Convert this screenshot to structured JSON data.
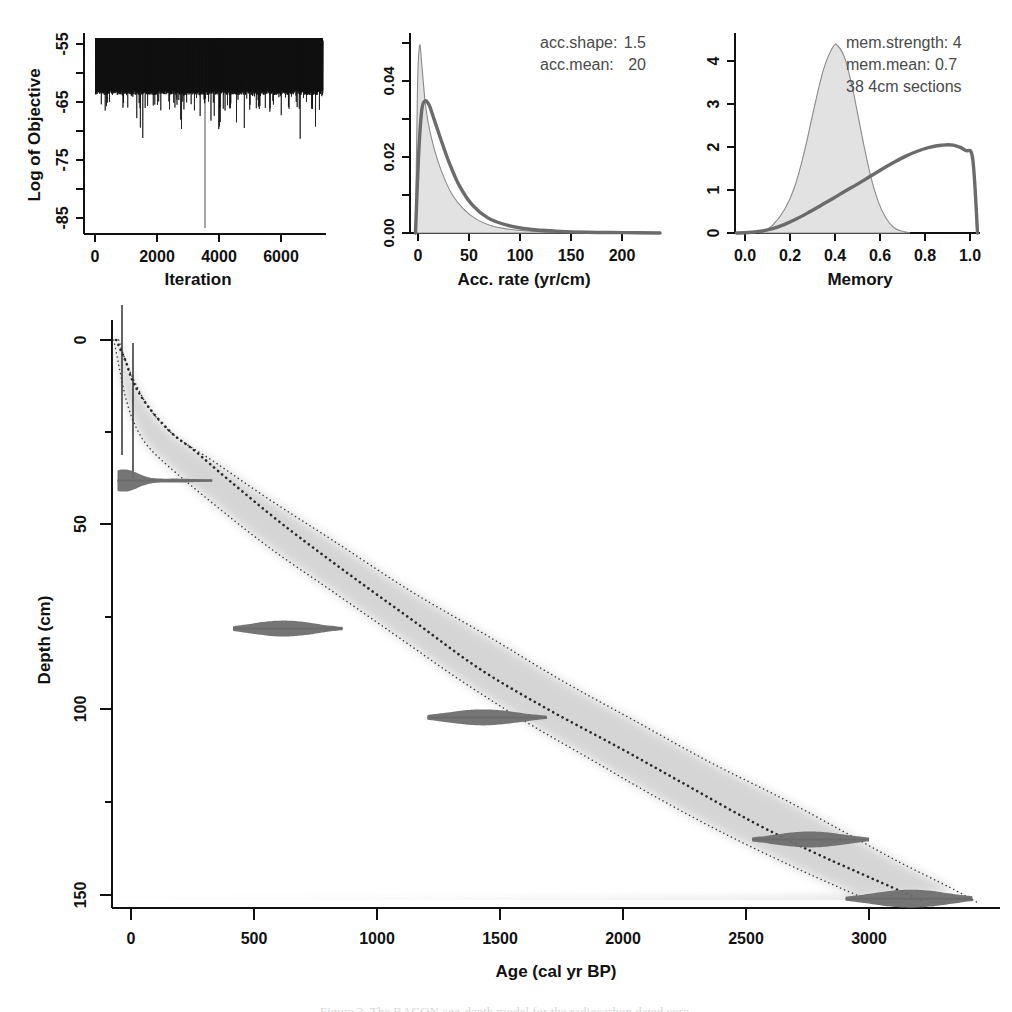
{
  "figure": {
    "caption": "Figure 3. The BACON age-depth model for the radiocarbon dated core."
  },
  "panels": {
    "mcmc": {
      "name": "Log of Objective trace",
      "ylabel": "Log of Objective",
      "xlabel": "Iteration",
      "yticks": [
        "-85",
        "-75",
        "-65",
        "-55"
      ],
      "ytick_values": [
        -85,
        -75,
        -65,
        -55
      ],
      "xticks": [
        "0",
        "2000",
        "4000",
        "6000"
      ],
      "xtick_values": [
        0,
        2000,
        4000,
        6000
      ],
      "xlim": [
        -300,
        7600
      ],
      "ylim": [
        -88,
        -52
      ]
    },
    "acc": {
      "name": "Accumulation rate prior and posterior",
      "xlabel": "Acc. rate (yr/cm)",
      "yticks": [
        "0.00",
        "0.02",
        "0.04"
      ],
      "ytick_values": [
        0.0,
        0.02,
        0.04
      ],
      "xticks": [
        "0",
        "50",
        "100",
        "150",
        "200"
      ],
      "xtick_values": [
        0,
        50,
        100,
        150,
        200
      ],
      "xlim": [
        -12,
        235
      ],
      "ylim": [
        0,
        0.053
      ],
      "annotations": [
        {
          "label": "acc.shape:",
          "value": "1.5"
        },
        {
          "label": "acc.mean:",
          "value": "20"
        }
      ]
    },
    "memory": {
      "name": "Memory prior and posterior",
      "xlabel": "Memory",
      "yticks": [
        "0",
        "1",
        "2",
        "3",
        "4"
      ],
      "ytick_values": [
        0,
        1,
        2,
        3,
        4
      ],
      "xticks": [
        "0.0",
        "0.2",
        "0.4",
        "0.6",
        "0.8",
        "1.0"
      ],
      "xtick_values": [
        0.0,
        0.2,
        0.4,
        0.6,
        0.8,
        1.0
      ],
      "xlim": [
        -0.06,
        1.06
      ],
      "ylim": [
        0,
        4.6
      ],
      "annotations": [
        {
          "label": "mem.strength:",
          "value": "4"
        },
        {
          "label": "mem.mean:",
          "value": "0.7"
        },
        {
          "label": "38 4cm sections",
          "value": ""
        }
      ]
    },
    "agedepth": {
      "name": "Age-depth model",
      "xlabel": "Age (cal yr BP)",
      "ylabel": "Depth (cm)",
      "xticks": [
        "0",
        "500",
        "1000",
        "1500",
        "2000",
        "2500",
        "3000"
      ],
      "xtick_values": [
        0,
        500,
        1000,
        1500,
        2000,
        2500,
        3000
      ],
      "yticks": [
        "0",
        "50",
        "100",
        "150"
      ],
      "ytick_values": [
        0,
        50,
        100,
        150
      ],
      "xlim": [
        -120,
        3560
      ],
      "ylim": [
        -8,
        160
      ]
    }
  },
  "chart_data": [
    {
      "type": "line",
      "name": "mcmc-trace",
      "title": "Log of Objective",
      "xlabel": "Iteration",
      "ylabel": "Log of Objective",
      "xlim": [
        -300,
        7600
      ],
      "ylim": [
        -88,
        -52
      ],
      "xticks": [
        0,
        2000,
        4000,
        6000
      ],
      "yticks": [
        -85,
        -75,
        -65,
        -55
      ],
      "description": "Dense MCMC trace oscillating mostly between -55 and -68, with occasional excursions to -77; one long vertical spike at iteration ~4400 reaching -87.",
      "band": {
        "upper": -54.5,
        "lower": -68.0,
        "spike_iteration": 4400,
        "spike_value": -87
      }
    },
    {
      "type": "area",
      "name": "acc-rate",
      "title": "Acc. rate (yr/cm)",
      "xlabel": "Acc. rate (yr/cm)",
      "ylabel": "",
      "xlim": [
        -12,
        235
      ],
      "ylim": [
        0,
        0.053
      ],
      "xticks": [
        0,
        50,
        100,
        150,
        200
      ],
      "yticks": [
        0.0,
        0.02,
        0.04
      ],
      "legend": [
        "prior",
        "posterior"
      ],
      "series": [
        {
          "name": "prior",
          "style": "thick-grey-line",
          "x": [
            0,
            3,
            6,
            9,
            13,
            18,
            24,
            32,
            42,
            55,
            70,
            88,
            110,
            135,
            165,
            200,
            235
          ],
          "y": [
            0.0,
            0.021,
            0.033,
            0.0355,
            0.0345,
            0.0305,
            0.0255,
            0.0192,
            0.0128,
            0.0074,
            0.004,
            0.0021,
            0.001,
            0.0005,
            0.0002,
            0.0001,
            0.0
          ]
        },
        {
          "name": "posterior",
          "style": "filled-grey",
          "x": [
            0,
            2,
            4,
            6,
            9,
            12,
            16,
            21,
            28,
            36,
            46,
            58,
            72,
            90,
            112,
            140,
            175,
            210,
            235
          ],
          "y": [
            0.0,
            0.04,
            0.0505,
            0.0455,
            0.036,
            0.03,
            0.0248,
            0.0198,
            0.0145,
            0.01,
            0.0065,
            0.0038,
            0.002,
            0.001,
            0.0005,
            0.0002,
            0.0001,
            0.0,
            0.0
          ]
        }
      ],
      "annotations": [
        "acc.shape:  1.5",
        "acc.mean:  20"
      ]
    },
    {
      "type": "area",
      "name": "memory",
      "title": "Memory",
      "xlabel": "Memory",
      "ylabel": "",
      "xlim": [
        -0.06,
        1.06
      ],
      "ylim": [
        0,
        4.6
      ],
      "xticks": [
        0.0,
        0.2,
        0.4,
        0.6,
        0.8,
        1.0
      ],
      "yticks": [
        0,
        1,
        2,
        3,
        4
      ],
      "legend": [
        "prior",
        "posterior"
      ],
      "series": [
        {
          "name": "prior",
          "style": "thick-grey-line",
          "x": [
            0.0,
            0.05,
            0.1,
            0.15,
            0.2,
            0.25,
            0.3,
            0.35,
            0.4,
            0.45,
            0.5,
            0.55,
            0.6,
            0.65,
            0.7,
            0.75,
            0.8,
            0.85,
            0.9,
            0.95,
            0.98,
            1.0
          ],
          "y": [
            0.0,
            0.01,
            0.04,
            0.1,
            0.2,
            0.33,
            0.48,
            0.64,
            0.8,
            0.97,
            1.13,
            1.3,
            1.47,
            1.63,
            1.78,
            1.9,
            1.99,
            2.04,
            2.04,
            1.92,
            1.72,
            0.0
          ]
        },
        {
          "name": "posterior",
          "style": "filled-grey",
          "x": [
            0.1,
            0.15,
            0.2,
            0.24,
            0.28,
            0.32,
            0.36,
            0.4,
            0.42,
            0.45,
            0.48,
            0.5,
            0.53,
            0.56,
            0.59,
            0.62,
            0.65,
            0.68,
            0.72
          ],
          "y": [
            0.0,
            0.18,
            0.55,
            1.05,
            1.85,
            2.85,
            3.78,
            4.32,
            4.35,
            4.05,
            3.4,
            2.85,
            2.0,
            1.25,
            0.7,
            0.35,
            0.14,
            0.05,
            0.0
          ]
        }
      ],
      "annotations": [
        "mem.strength: 4",
        "mem.mean: 0.7",
        "38 4cm sections"
      ]
    },
    {
      "type": "line",
      "name": "age-depth-model",
      "title": "Age-depth model",
      "xlabel": "Age (cal yr BP)",
      "ylabel": "Depth (cm)",
      "xlim": [
        -120,
        3560
      ],
      "ylim": [
        -8,
        160
      ],
      "xticks": [
        0,
        500,
        1000,
        1500,
        2000,
        2500,
        3000
      ],
      "yticks": [
        0,
        50,
        100,
        150
      ],
      "series": [
        {
          "name": "mean-model",
          "style": "dotted-black",
          "age": [
            -60,
            -40,
            -20,
            0,
            30,
            70,
            120,
            180,
            260,
            400,
            620,
            880,
            1150,
            1420,
            1700,
            1980,
            2250,
            2520,
            2760,
            2960,
            3130,
            3230
          ],
          "depth": [
            0,
            3,
            6,
            10,
            14,
            18,
            22,
            26,
            30,
            38,
            50,
            63,
            76,
            89,
            100,
            110,
            120,
            130,
            138,
            144,
            149,
            152
          ]
        },
        {
          "name": "ci-upper",
          "style": "dotted-thin",
          "age": [
            -70,
            -55,
            -40,
            -20,
            10,
            60,
            150,
            330,
            560,
            820,
            1080,
            1340,
            1600,
            1860,
            2120,
            2400,
            2680,
            2880,
            3020
          ],
          "depth": [
            0,
            5,
            10,
            16,
            22,
            28,
            34,
            44,
            56,
            68,
            80,
            92,
            103,
            113,
            123,
            133,
            142,
            148,
            152
          ]
        },
        {
          "name": "ci-lower",
          "style": "dotted-thin",
          "age": [
            -50,
            -20,
            20,
            80,
            180,
            340,
            560,
            840,
            1140,
            1450,
            1750,
            2050,
            2350,
            2650,
            2900,
            3120,
            3330,
            3440
          ],
          "depth": [
            0,
            6,
            12,
            19,
            26,
            33,
            43,
            55,
            68,
            80,
            92,
            103,
            114,
            124,
            133,
            141,
            148,
            152
          ]
        }
      ],
      "dates": [
        {
          "depth": 38,
          "age_mean": 60,
          "age_lo": -55,
          "age_hi": 330,
          "bar_lo": -55,
          "bar_hi": 330
        },
        {
          "depth": 78,
          "age_mean": 620,
          "age_lo": 420,
          "age_hi": 860,
          "bar_lo": 415,
          "bar_hi": 860
        },
        {
          "depth": 102,
          "age_mean": 1430,
          "age_lo": 1210,
          "age_hi": 1690,
          "bar_lo": 1205,
          "bar_hi": 1690
        },
        {
          "depth": 135,
          "age_mean": 2760,
          "age_lo": 2530,
          "age_hi": 3000,
          "bar_lo": 2525,
          "bar_hi": 3000
        },
        {
          "depth": 151,
          "age_mean": 3170,
          "age_lo": 2910,
          "age_hi": 3420,
          "bar_lo": 2905,
          "bar_hi": 3420
        }
      ]
    }
  ]
}
